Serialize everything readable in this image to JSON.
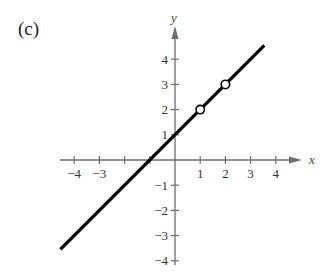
{
  "panel_label": "(c)",
  "chart_data": {
    "type": "line",
    "title": "",
    "panel": "(c)",
    "xlabel": "x",
    "ylabel": "y",
    "xlim": [
      -4.5,
      4.5
    ],
    "ylim": [
      -4.5,
      4.5
    ],
    "grid": false,
    "x_ticks": [
      -4,
      -3,
      -2,
      -1,
      1,
      2,
      3,
      4
    ],
    "x_tick_labels": [
      "−4",
      "−3",
      "",
      "",
      "1",
      "2",
      "3",
      "4"
    ],
    "y_ticks": [
      -4,
      -3,
      -2,
      -1,
      1,
      2,
      3,
      4
    ],
    "y_tick_labels": [
      "−4",
      "−3",
      "−2",
      "−1",
      "1",
      "2",
      "3",
      "4"
    ],
    "series": [
      {
        "name": "y = x + 1",
        "x": [
          -4.5,
          3.5
        ],
        "y": [
          -3.5,
          4.5
        ],
        "color": "#000000"
      }
    ],
    "open_points": [
      {
        "x": 1,
        "y": 2
      },
      {
        "x": 2,
        "y": 3
      }
    ]
  }
}
